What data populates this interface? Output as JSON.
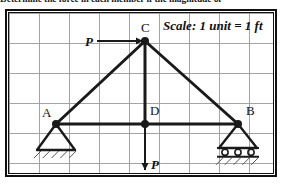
{
  "problem_text": "Determine the force in each member if the magnitude of",
  "scale_note": "Scale: 1 unit = 1 ft",
  "labels": {
    "node_a": "A",
    "node_b": "B",
    "node_c": "C",
    "node_d": "D",
    "force_horizontal": "P",
    "force_vertical": "P"
  },
  "diagram": {
    "type": "truss-free-body-diagram",
    "grid": {
      "unit_px": 30,
      "cols": 9,
      "rows": 6,
      "line_color": "#9a9a9a",
      "background": "#ffffff"
    },
    "frame_color": "#111111",
    "member_color": "#1a1a1a",
    "nodes": [
      {
        "id": "A",
        "x": 56,
        "y": 124,
        "label_dx": -14,
        "label_dy": -18,
        "support": "pin"
      },
      {
        "id": "B",
        "x": 238,
        "y": 124,
        "label_dx": 8,
        "label_dy": -20,
        "support": "roller"
      },
      {
        "id": "C",
        "x": 145,
        "y": 41,
        "label_dx": -4,
        "label_dy": -20,
        "support": "none"
      },
      {
        "id": "D",
        "x": 145,
        "y": 124,
        "label_dx": 5,
        "label_dy": -20,
        "support": "none"
      }
    ],
    "members": [
      {
        "from": "A",
        "to": "C"
      },
      {
        "from": "C",
        "to": "B"
      },
      {
        "from": "A",
        "to": "B"
      },
      {
        "from": "C",
        "to": "D"
      }
    ],
    "forces": [
      {
        "label": "P",
        "at": "C",
        "direction": "right",
        "tail_x": 97,
        "tail_y": 41,
        "head_x": 143,
        "head_y": 41
      },
      {
        "label": "P",
        "at": "D",
        "direction": "down",
        "tail_x": 145,
        "tail_y": 124,
        "head_x": 145,
        "head_y": 170
      }
    ],
    "supports": {
      "pin": {
        "description": "triangle with hatched ground",
        "half_width": 19,
        "height": 26
      },
      "roller": {
        "description": "triangle on three rollers with hatched ground",
        "half_width": 19,
        "height": 24,
        "roller_count": 3
      }
    }
  },
  "colors": {
    "ink": "#111111",
    "grid": "#9a9a9a",
    "paper": "#ffffff"
  }
}
